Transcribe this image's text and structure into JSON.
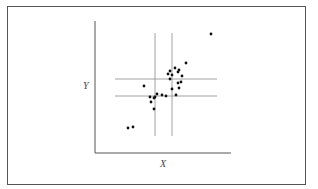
{
  "chart_data": {
    "type": "scatter",
    "title": "",
    "xlabel": "X",
    "ylabel": "Y",
    "grid": false,
    "legend": null,
    "axis_ticks": "none",
    "reference_lines": {
      "vertical": [
        155,
        172
      ],
      "horizontal": [
        79,
        96
      ],
      "note": "two vertical and two horizontal reference lines bracketing the central cluster (pixel coordinates)"
    },
    "points": [
      {
        "x": 211,
        "y": 34
      },
      {
        "x": 186,
        "y": 63
      },
      {
        "x": 175,
        "y": 68
      },
      {
        "x": 170,
        "y": 71
      },
      {
        "x": 179,
        "y": 70
      },
      {
        "x": 178,
        "y": 72
      },
      {
        "x": 168,
        "y": 74
      },
      {
        "x": 172,
        "y": 75
      },
      {
        "x": 182,
        "y": 76
      },
      {
        "x": 170,
        "y": 79
      },
      {
        "x": 181,
        "y": 82
      },
      {
        "x": 178,
        "y": 83
      },
      {
        "x": 144,
        "y": 86
      },
      {
        "x": 172,
        "y": 89
      },
      {
        "x": 179,
        "y": 88
      },
      {
        "x": 176,
        "y": 95
      },
      {
        "x": 157,
        "y": 94
      },
      {
        "x": 162,
        "y": 95
      },
      {
        "x": 166,
        "y": 96
      },
      {
        "x": 150,
        "y": 97
      },
      {
        "x": 155,
        "y": 97
      },
      {
        "x": 154,
        "y": 98
      },
      {
        "x": 151,
        "y": 102
      },
      {
        "x": 154,
        "y": 109
      },
      {
        "x": 128,
        "y": 128
      },
      {
        "x": 133,
        "y": 127
      }
    ]
  },
  "labels": {
    "x": "X",
    "y": "Y"
  },
  "colors": {
    "frame": "#555555",
    "axis": "#555555",
    "reflines": "#8a8a8a",
    "points": "#111111"
  }
}
